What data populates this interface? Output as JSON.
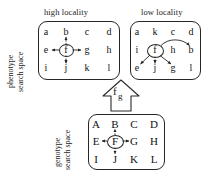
{
  "figure": {
    "type": "diagram"
  },
  "phenotype": {
    "axis_label_line1": "phenotype",
    "axis_label_line2": "search space",
    "panels": [
      {
        "id": "high-locality",
        "title": "high locality",
        "grid": [
          [
            "a",
            "b",
            "c",
            "d"
          ],
          [
            "e",
            "f",
            "g",
            "h"
          ],
          [
            "i",
            "j",
            "k",
            "l"
          ]
        ],
        "center": "f",
        "neighbors": [
          "b",
          "e",
          "g",
          "j"
        ]
      },
      {
        "id": "low-locality",
        "title": "low locality",
        "grid": [
          [
            "a",
            "k",
            "c",
            "d"
          ],
          [
            "i",
            "f",
            "h",
            "b"
          ],
          [
            "e",
            "j",
            "g",
            "l"
          ]
        ],
        "center": "f",
        "neighbors": [
          "b",
          "e",
          "j",
          "g"
        ]
      }
    ]
  },
  "genotype": {
    "axis_label_line1": "genotype",
    "axis_label_line2": "search space",
    "panel": {
      "id": "genotype-space",
      "grid": [
        [
          "A",
          "B",
          "C",
          "D"
        ],
        [
          "E",
          "F",
          "G",
          "H"
        ],
        [
          "I",
          "J",
          "K",
          "L"
        ]
      ],
      "center": "F",
      "neighbors": [
        "B",
        "E",
        "G",
        "J"
      ]
    }
  },
  "mapping_arrow": {
    "name": "genotype-phenotype-mapping",
    "label_main": "f",
    "label_sub": "g",
    "direction": "up"
  },
  "colors": {
    "stroke": "#262626",
    "text": "#121212",
    "background": "#ffffff"
  }
}
